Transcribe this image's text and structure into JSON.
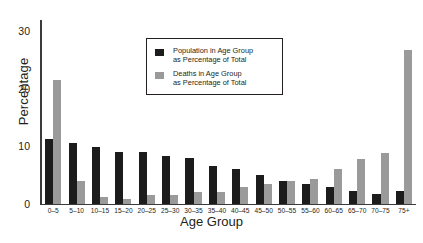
{
  "chart_data": {
    "type": "bar",
    "title": "",
    "xlabel": "Age Group",
    "ylabel": "Percentage",
    "ylim": [
      0,
      32
    ],
    "yticks": [
      0,
      10,
      20,
      30
    ],
    "grid": false,
    "legend_position": "top-center",
    "categories": [
      "0–5",
      "5–10",
      "10–15",
      "15–20",
      "20–25",
      "25–30",
      "30–35",
      "35–40",
      "40–45",
      "45–50",
      "50–55",
      "55–60",
      "60–65",
      "65–70",
      "70–75",
      "75+"
    ],
    "series": [
      {
        "name": "Population in Age Group as Percentage of Total",
        "color": "#1c1c1c",
        "values": [
          11.3,
          10.5,
          9.9,
          9.0,
          9.0,
          8.3,
          7.9,
          6.5,
          6.0,
          4.9,
          3.9,
          3.4,
          2.9,
          2.2,
          1.7,
          2.1
        ]
      },
      {
        "name": "Deaths in Age Group as Percentage of Total",
        "color": "#9a9a9a",
        "values": [
          21.5,
          4.0,
          1.1,
          0.8,
          1.5,
          1.5,
          2.0,
          2.0,
          2.9,
          3.4,
          3.9,
          4.3,
          6.0,
          7.7,
          8.8,
          26.7
        ]
      }
    ]
  },
  "legend": {
    "items": [
      {
        "line1": "Population in Age Group",
        "line2": "as Percentage of Total",
        "swatch": "dark"
      },
      {
        "line1": "Deaths in Age Group",
        "line2": "as Percentage of Total",
        "swatch": "gray"
      }
    ]
  },
  "caption": {
    "text": ""
  }
}
